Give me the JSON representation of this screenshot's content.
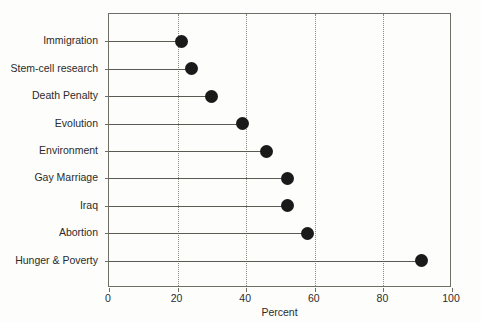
{
  "chart_data": {
    "type": "scatter",
    "variant": "dot-plot",
    "title": "",
    "subtitle": "",
    "xlabel": "Percent",
    "ylabel": "",
    "xlim": [
      0,
      100
    ],
    "xticks": [
      0,
      20,
      40,
      60,
      80,
      100
    ],
    "xticklabels": [
      "0",
      "20",
      "40",
      "60",
      "80",
      "100"
    ],
    "grid": "vertical-dotted-at-xticks",
    "legend": "none",
    "marker": {
      "shape": "circle",
      "color": "#1a1a1a",
      "size_px": 13
    },
    "stem_color": "#5a5a52",
    "frame_color": "#6e6e66",
    "categories": [
      "Immigration",
      "Stem-cell research",
      "Death Penalty",
      "Evolution",
      "Environment",
      "Gay Marriage",
      "Iraq",
      "Abortion",
      "Hunger & Poverty"
    ],
    "values": [
      21,
      24,
      30,
      39,
      46,
      52,
      52,
      58,
      91
    ],
    "points": [
      {
        "category": "Immigration",
        "value": 21
      },
      {
        "category": "Stem-cell research",
        "value": 24
      },
      {
        "category": "Death Penalty",
        "value": 30
      },
      {
        "category": "Evolution",
        "value": 39
      },
      {
        "category": "Environment",
        "value": 46
      },
      {
        "category": "Gay Marriage",
        "value": 52
      },
      {
        "category": "Iraq",
        "value": 52
      },
      {
        "category": "Abortion",
        "value": 58
      },
      {
        "category": "Hunger & Poverty",
        "value": 91
      }
    ],
    "annotations": []
  }
}
